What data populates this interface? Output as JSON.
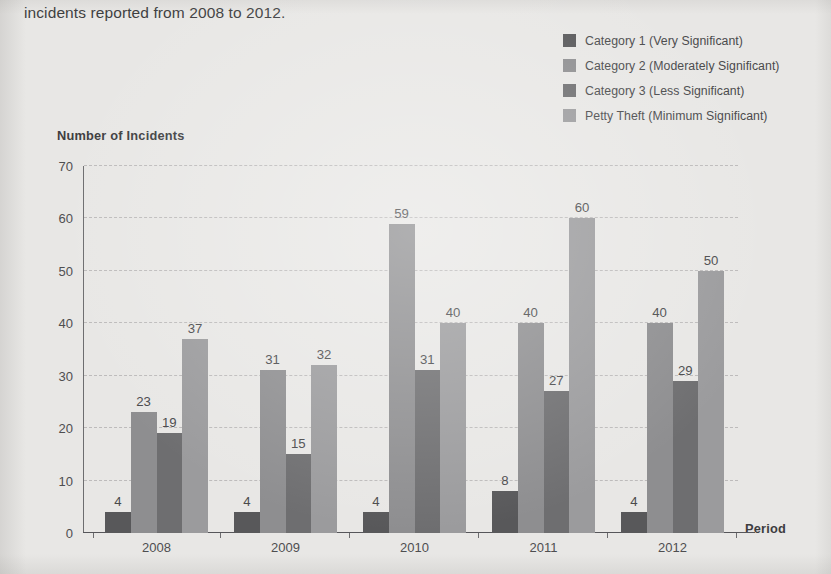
{
  "caption": "incidents reported from 2008 to 2012.",
  "axis_titles": {
    "y": "Number of Incidents",
    "x": "Period"
  },
  "legend": {
    "items": [
      {
        "label": "Category 1 (Very Significant)",
        "color": "#58585a"
      },
      {
        "label": "Category 2 (Moderately Significant)",
        "color": "#8e8e90"
      },
      {
        "label": "Category 3 (Less Significant)",
        "color": "#6e6e70"
      },
      {
        "label": "Petty Theft (Minimum Significant)",
        "color": "#9b9b9d"
      }
    ]
  },
  "chart_data": {
    "type": "bar",
    "title": "",
    "xlabel": "Period",
    "ylabel": "Number of Incidents",
    "ylim": [
      0,
      70
    ],
    "yticks": [
      0,
      10,
      20,
      30,
      40,
      50,
      60,
      70
    ],
    "grid": true,
    "legend_position": "top-right",
    "categories": [
      "2008",
      "2009",
      "2010",
      "2011",
      "2012"
    ],
    "series": [
      {
        "name": "Category 1 (Very Significant)",
        "color": "#58585a",
        "values": [
          4,
          4,
          4,
          8,
          4
        ]
      },
      {
        "name": "Category 2 (Moderately Significant)",
        "color": "#8e8e90",
        "values": [
          23,
          31,
          59,
          40,
          40
        ]
      },
      {
        "name": "Category 3 (Less Significant)",
        "color": "#6e6e70",
        "values": [
          19,
          15,
          31,
          27,
          29
        ]
      },
      {
        "name": "Petty Theft (Minimum Significant)",
        "color": "#9b9b9d",
        "values": [
          37,
          32,
          40,
          60,
          50
        ]
      }
    ]
  }
}
